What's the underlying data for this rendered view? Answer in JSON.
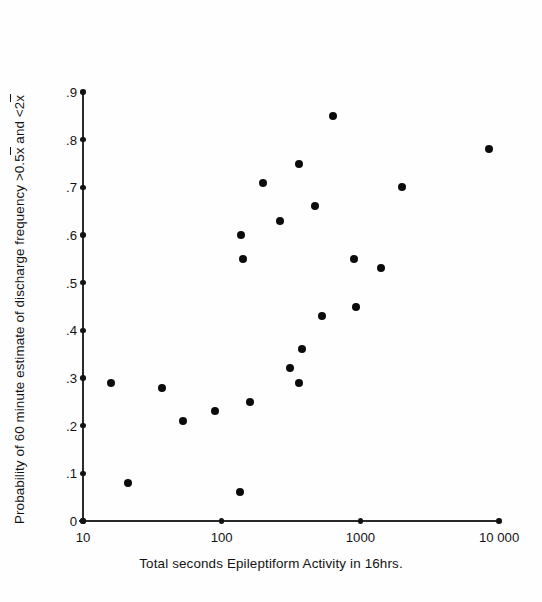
{
  "chart_data": {
    "type": "scatter",
    "title": "",
    "xlabel": "Total seconds Epileptiform Activity in 16hrs.",
    "ylabel_plain": "Probability of 60 minute estimate of discharge frequency >0.5x̄ and <2x̄",
    "ylabel_parts": {
      "a": "Probability of 60 minute estimate of discharge frequency >0.5",
      "b": "x",
      "c": " and <2",
      "d": "x"
    },
    "xscale": "log",
    "yscale": "linear",
    "xlim": [
      10,
      10000
    ],
    "ylim": [
      0,
      0.9
    ],
    "grid": false,
    "legend": false,
    "xticks": [
      10,
      100,
      1000,
      10000
    ],
    "xtick_labels": [
      "10",
      "100",
      "1000",
      "10 000"
    ],
    "yticks": [
      0,
      0.1,
      0.2,
      0.3,
      0.4,
      0.5,
      0.6,
      0.7,
      0.8,
      0.9
    ],
    "ytick_labels": [
      "0",
      ".1",
      ".2",
      ".3",
      ".4",
      ".5",
      ".6",
      ".7",
      ".8",
      ".9"
    ],
    "marker": "filled-circle",
    "marker_color": "#0b0b0b",
    "axis_color": "#2a2a2a",
    "points": [
      {
        "x": 16,
        "y": 0.29
      },
      {
        "x": 21,
        "y": 0.08
      },
      {
        "x": 37,
        "y": 0.28
      },
      {
        "x": 53,
        "y": 0.21
      },
      {
        "x": 90,
        "y": 0.23
      },
      {
        "x": 135,
        "y": 0.06
      },
      {
        "x": 137,
        "y": 0.6
      },
      {
        "x": 142,
        "y": 0.55
      },
      {
        "x": 160,
        "y": 0.25
      },
      {
        "x": 200,
        "y": 0.71
      },
      {
        "x": 265,
        "y": 0.63
      },
      {
        "x": 310,
        "y": 0.32
      },
      {
        "x": 360,
        "y": 0.75
      },
      {
        "x": 360,
        "y": 0.29
      },
      {
        "x": 380,
        "y": 0.36
      },
      {
        "x": 470,
        "y": 0.66
      },
      {
        "x": 530,
        "y": 0.43
      },
      {
        "x": 630,
        "y": 0.85
      },
      {
        "x": 900,
        "y": 0.55
      },
      {
        "x": 925,
        "y": 0.45
      },
      {
        "x": 1400,
        "y": 0.53
      },
      {
        "x": 2000,
        "y": 0.7
      },
      {
        "x": 8500,
        "y": 0.78
      }
    ],
    "n_points": 23
  }
}
